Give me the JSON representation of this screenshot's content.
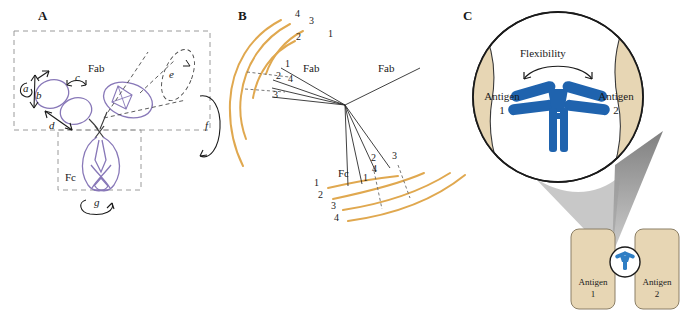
{
  "figure": {
    "width": 697,
    "height": 318,
    "background": "#ffffff"
  },
  "colors": {
    "antibody_purple": "#8878b8",
    "arc_orange": "#e0a84f",
    "antibody_blue": "#1f63ae",
    "antigen_tan": "#e7d6b4",
    "shadow_gray": "#8f8f8f",
    "outline_black": "#1a1a1a",
    "dashed_gray": "#9a9a9a"
  },
  "panel_a": {
    "letter": "A",
    "fab_label": "Fab",
    "fc_label": "Fc",
    "motion_labels": [
      {
        "id": "a",
        "text": "a"
      },
      {
        "id": "b",
        "text": "b"
      },
      {
        "id": "c",
        "text": "c"
      },
      {
        "id": "d",
        "text": "d"
      },
      {
        "id": "e",
        "text": "e"
      },
      {
        "id": "f",
        "text": "f"
      },
      {
        "id": "g",
        "text": "g"
      }
    ]
  },
  "panel_b": {
    "letter": "B",
    "fab_label_left": "Fab",
    "fab_label_right": "Fab",
    "fc_label": "Fc",
    "upper_arc_numbers": [
      "4",
      "3",
      "2",
      "1"
    ],
    "upper_ray_numbers": [
      "1",
      "2",
      "4",
      "3"
    ],
    "lower_arc_numbers": [
      "1",
      "2",
      "3",
      "4"
    ],
    "lower_ray_numbers": [
      "1",
      "4",
      "2",
      "3"
    ]
  },
  "panel_c": {
    "letter": "C",
    "flexibility_label": "Flexibility",
    "magnified": {
      "antigen_left_name": "Antigen",
      "antigen_left_number": "1",
      "antigen_right_name": "Antigen",
      "antigen_right_number": "2"
    },
    "overview": {
      "antigen_left_name": "Antigen",
      "antigen_left_number": "1",
      "antigen_right_name": "Antigen",
      "antigen_right_number": "2"
    }
  }
}
